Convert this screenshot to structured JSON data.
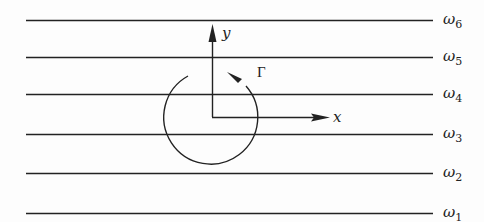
{
  "diagram": {
    "lines": [
      {
        "label": "ω",
        "sub": "6",
        "y": 20
      },
      {
        "label": "ω",
        "sub": "5",
        "y": 57
      },
      {
        "label": "ω",
        "sub": "4",
        "y": 94
      },
      {
        "label": "ω",
        "sub": "3",
        "y": 134
      },
      {
        "label": "ω",
        "sub": "2",
        "y": 173
      },
      {
        "label": "ω",
        "sub": "1",
        "y": 213
      }
    ],
    "axes": {
      "x_label": "x",
      "y_label": "y"
    },
    "circulation_label": "Γ",
    "colors": {
      "stroke": "#222222",
      "background": "#fdfdfd"
    }
  }
}
